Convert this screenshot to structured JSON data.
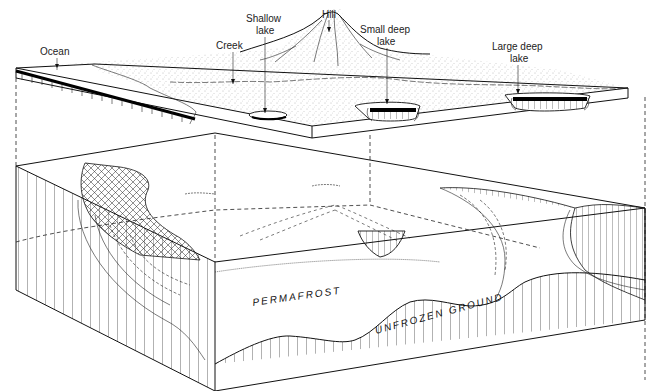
{
  "diagram": {
    "labels": {
      "ocean": "Ocean",
      "creek": "Creek",
      "shallow_lake_1": "Shallow",
      "shallow_lake_2": "lake",
      "hill": "Hill",
      "small_deep_lake_1": "Small deep",
      "small_deep_lake_2": "lake",
      "large_deep_lake_1": "Large deep",
      "large_deep_lake_2": "lake",
      "permafrost": "PERMAFROST",
      "unfrozen_ground": "UNFROZEN GROUND"
    },
    "colors": {
      "ink": "#111111",
      "background": "#ffffff",
      "stipple": "#888888"
    }
  }
}
